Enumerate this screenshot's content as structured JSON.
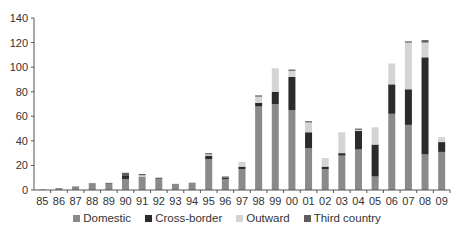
{
  "chart_data": {
    "type": "bar",
    "stacked": true,
    "title": "",
    "xlabel": "",
    "ylabel": "",
    "ylim": [
      0,
      140
    ],
    "yticks": [
      0,
      20,
      40,
      60,
      80,
      100,
      120,
      140
    ],
    "grid": false,
    "legend_position": "bottom",
    "categories": [
      "85",
      "86",
      "87",
      "88",
      "89",
      "90",
      "91",
      "92",
      "93",
      "94",
      "95",
      "96",
      "97",
      "98",
      "99",
      "00",
      "01",
      "02",
      "03",
      "04",
      "05",
      "06",
      "07",
      "08",
      "09"
    ],
    "series": [
      {
        "name": "Domestic",
        "color": "#8a8a8a",
        "values": [
          0.5,
          1,
          2.5,
          5,
          5,
          9,
          11,
          9,
          5,
          6,
          25,
          9,
          17,
          68,
          70,
          65,
          34,
          17,
          28,
          33,
          11,
          62,
          53,
          29,
          31
        ]
      },
      {
        "name": "Cross-border",
        "color": "#2b2b2b",
        "values": [
          0,
          0,
          0,
          0,
          0,
          3,
          0,
          0,
          0,
          0,
          3,
          1,
          2,
          3,
          10,
          27,
          13,
          2,
          2,
          15,
          26,
          24,
          29,
          79,
          8
        ]
      },
      {
        "name": "Outward",
        "color": "#d4d4d4",
        "values": [
          0,
          0,
          0,
          0,
          0,
          0,
          1,
          0,
          0,
          0,
          1,
          0,
          4,
          5,
          19,
          5,
          8,
          7,
          17,
          1,
          14,
          17,
          38,
          12,
          4
        ]
      },
      {
        "name": "Third country",
        "color": "#5e5e5e",
        "values": [
          0,
          0.3,
          0.3,
          0.5,
          0.8,
          2,
          1,
          1,
          0,
          0,
          1,
          1,
          0,
          1,
          0,
          1,
          1,
          0,
          0,
          1,
          0,
          0,
          1,
          2,
          0
        ]
      }
    ]
  }
}
